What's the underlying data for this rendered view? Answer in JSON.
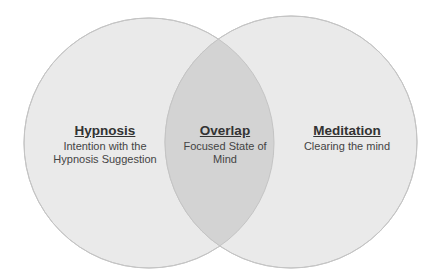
{
  "diagram": {
    "type": "venn",
    "colors": {
      "background": "#ffffff",
      "circle_fill": "#eaeaea",
      "overlap_fill": "#d3d3d3",
      "circle_stroke": "#c4c4c4",
      "text": "#3a3a3a"
    },
    "circles": [
      {
        "id": "left",
        "title": "Hypnosis",
        "description_lines": [
          "Intention with the",
          "Hypnosis Suggestion"
        ]
      },
      {
        "id": "right",
        "title": "Meditation",
        "description_lines": [
          "Clearing the mind"
        ]
      }
    ],
    "overlap": {
      "title": "Overlap",
      "description_lines": [
        "Focused State of",
        "Mind"
      ]
    }
  }
}
